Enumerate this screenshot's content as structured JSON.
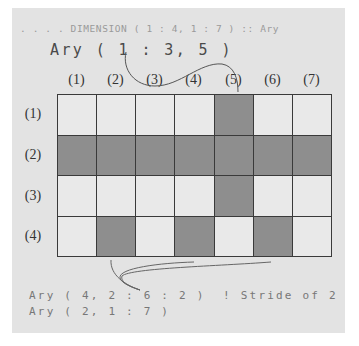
{
  "code": {
    "declaration": ". . . . DIMENSION ( 1 : 4, 1 : 7 ) :: Ary",
    "section_column": "Ary ( 1 : 3, 5 )",
    "section_stride": "Ary ( 4, 2 : 6 : 2 )  ! Stride of 2",
    "section_row": "Ary ( 2, 1 : 7 )"
  },
  "grid": {
    "rows": 4,
    "cols": 7,
    "col_labels": [
      "(1)",
      "(2)",
      "(3)",
      "(4)",
      "(5)",
      "(6)",
      "(7)"
    ],
    "row_labels": [
      "(1)",
      "(2)",
      "(3)",
      "(4)"
    ],
    "selected": [
      [
        0,
        0,
        0,
        0,
        1,
        0,
        0
      ],
      [
        1,
        1,
        1,
        1,
        1,
        1,
        1
      ],
      [
        0,
        0,
        0,
        0,
        1,
        0,
        0
      ],
      [
        0,
        1,
        0,
        1,
        0,
        1,
        0
      ]
    ]
  },
  "colors": {
    "panel_bg": "#e3e3e3",
    "cell_unselected": "#e9e9e9",
    "cell_selected": "#8e8e8e",
    "grid_line": "#3a3a3a"
  }
}
